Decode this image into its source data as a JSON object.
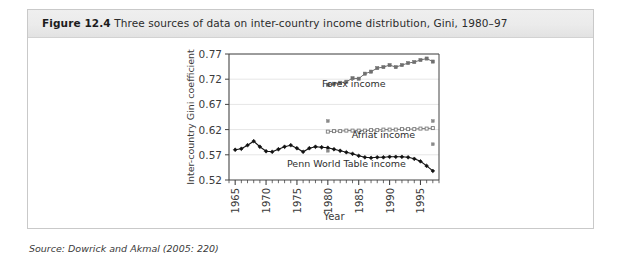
{
  "figure": {
    "number": "Figure 12.4",
    "caption": "Three sources of data on inter-country income distribution, Gini, 1980–97",
    "source": "Source: Dowrick and Akmal (2005: 220)"
  },
  "colors": {
    "frame_border": "#c9c9c9",
    "header_band": "#ebebeb",
    "plot_border": "#444444",
    "gridline": "#e6e6e6",
    "penn_series": "#111111",
    "forex_series": "#6f6f6f",
    "afriat_series": "#7a7a7a",
    "axis_text": "#3b3b3b"
  },
  "chart_data": {
    "type": "line",
    "title": "",
    "xlabel": "Year",
    "ylabel": "Inter-country Gini coefficient",
    "xlim": [
      1964,
      1998
    ],
    "ylim": [
      0.52,
      0.77
    ],
    "yticks": [
      "0.52",
      "0.57",
      "0.62",
      "0.67",
      "0.72",
      "0.77"
    ],
    "ytick_values": [
      0.52,
      0.57,
      0.62,
      0.67,
      0.72,
      0.77
    ],
    "xticks": [
      "1965",
      "1970",
      "1975",
      "1980",
      "1985",
      "1990",
      "1995"
    ],
    "xtick_values": [
      1965,
      1970,
      1975,
      1980,
      1985,
      1990,
      1995
    ],
    "xtick_minor_step": 1,
    "grid": "horizontal",
    "legend": "inline-annotations",
    "annotations": [
      {
        "text": "Forex income",
        "x": 1984.2,
        "y": 0.705
      },
      {
        "text": "Afriat income",
        "x": 1989.0,
        "y": 0.603
      },
      {
        "text": "Penn World Table income",
        "x": 1983.0,
        "y": 0.545
      }
    ],
    "series": [
      {
        "name": "Penn World Table income",
        "color": "#111111",
        "marker": "filled-diamond",
        "x": [
          1965,
          1966,
          1967,
          1968,
          1969,
          1970,
          1971,
          1972,
          1973,
          1974,
          1975,
          1976,
          1977,
          1978,
          1979,
          1980,
          1981,
          1982,
          1983,
          1984,
          1985,
          1986,
          1987,
          1988,
          1989,
          1990,
          1991,
          1992,
          1993,
          1994,
          1995,
          1996,
          1997
        ],
        "values": [
          0.58,
          0.582,
          0.589,
          0.597,
          0.586,
          0.577,
          0.576,
          0.581,
          0.586,
          0.589,
          0.583,
          0.576,
          0.583,
          0.586,
          0.585,
          0.584,
          0.581,
          0.578,
          0.575,
          0.572,
          0.568,
          0.565,
          0.564,
          0.565,
          0.565,
          0.566,
          0.566,
          0.566,
          0.565,
          0.562,
          0.557,
          0.548,
          0.538
        ]
      },
      {
        "name": "Forex income",
        "color": "#6f6f6f",
        "marker": "filled-square",
        "x": [
          1980,
          1981,
          1982,
          1983,
          1984,
          1985,
          1986,
          1987,
          1988,
          1989,
          1990,
          1991,
          1992,
          1993,
          1994,
          1995,
          1996,
          1997
        ],
        "values": [
          0.709,
          0.711,
          0.713,
          0.715,
          0.722,
          0.721,
          0.731,
          0.735,
          0.742,
          0.744,
          0.748,
          0.744,
          0.748,
          0.752,
          0.754,
          0.758,
          0.761,
          0.755
        ]
      },
      {
        "name": "Afriat income",
        "color": "#7a7a7a",
        "marker": "open-square",
        "x": [
          1980,
          1981,
          1982,
          1983,
          1984,
          1985,
          1986,
          1987,
          1988,
          1989,
          1990,
          1991,
          1992,
          1993,
          1994,
          1995,
          1996,
          1997
        ],
        "values": [
          0.616,
          0.617,
          0.617,
          0.618,
          0.618,
          0.618,
          0.618,
          0.619,
          0.619,
          0.62,
          0.62,
          0.62,
          0.621,
          0.621,
          0.621,
          0.622,
          0.622,
          0.623
        ]
      }
    ],
    "interval_markers": [
      {
        "series": "Afriat income",
        "x": 1980,
        "y": 0.637,
        "kind": "upper-bound"
      },
      {
        "series": "Afriat income",
        "x": 1980,
        "y": 0.578,
        "kind": "lower-bound"
      },
      {
        "series": "Afriat income",
        "x": 1997,
        "y": 0.637,
        "kind": "upper-bound"
      },
      {
        "series": "Afriat income",
        "x": 1997,
        "y": 0.591,
        "kind": "lower-bound"
      }
    ]
  }
}
